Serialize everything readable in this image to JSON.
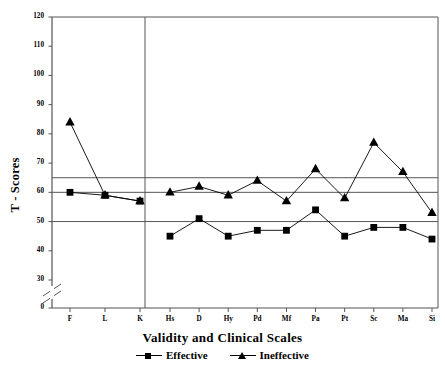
{
  "chart_data": {
    "type": "line",
    "title": "",
    "xlabel": "Validity and Clinical Scales",
    "ylabel": "T - Scores",
    "categories": [
      "F",
      "L",
      "K",
      "Hs",
      "D",
      "Hy",
      "Pd",
      "Mf",
      "Pa",
      "Pt",
      "Sc",
      "Ma",
      "Si"
    ],
    "ylim": [
      0,
      120
    ],
    "yticks": [
      0,
      30,
      40,
      50,
      60,
      70,
      80,
      90,
      100,
      110,
      120
    ],
    "ytick_labels": [
      "0",
      "30",
      "40",
      "50",
      "60",
      "70",
      "80",
      "90",
      "100",
      "110",
      "120"
    ],
    "axis_break": true,
    "axis_break_between": [
      0,
      30
    ],
    "grid": false,
    "reference_lines": [
      65,
      60,
      50
    ],
    "group_divider_after": "K",
    "legend_position": "below",
    "series": [
      {
        "name": "Effective",
        "marker": "square",
        "color": "#000000",
        "values": [
          60,
          59,
          57,
          45,
          51,
          45,
          47,
          47,
          54,
          45,
          48,
          48,
          44
        ]
      },
      {
        "name": "Ineffective",
        "marker": "triangle",
        "color": "#000000",
        "values": [
          84,
          59,
          57,
          60,
          62,
          59,
          64,
          57,
          68,
          58,
          77,
          67,
          53
        ]
      }
    ]
  },
  "legend": {
    "entries": [
      {
        "label": "Effective",
        "marker": "square-marker"
      },
      {
        "label": "Ineffective",
        "marker": "triangle-marker"
      }
    ]
  }
}
